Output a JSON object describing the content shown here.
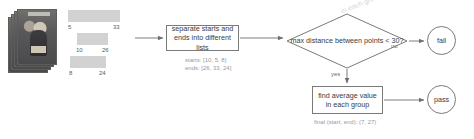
{
  "diagram": {
    "type": "flowchart",
    "source": {
      "name": "photo-stack",
      "count": 4
    },
    "intervals": [
      {
        "start": "5",
        "end": "33"
      },
      {
        "start": "10",
        "end": "26"
      },
      {
        "start": "8",
        "end": "24"
      }
    ],
    "nodes": {
      "separate": {
        "line1": "separate starts and",
        "line2": "ends into different lists"
      },
      "decision": {
        "line1": "max distance between",
        "line2": "points < 30?"
      },
      "average": {
        "line1": "find average value",
        "line2": "in each group"
      },
      "fail": {
        "label": "fail"
      },
      "pass": {
        "label": "pass"
      }
    },
    "edge_labels": {
      "no": "no",
      "yes": "yes"
    },
    "annotations": {
      "starts": "starts: [10, 5, 8]",
      "ends": "ends: [26, 33, 24]",
      "final": "final (start, end): (7, 27)",
      "ghost": "in each group"
    },
    "colors": {
      "bar": "#d2d2d2",
      "stroke": "#7a7a7a",
      "text": "#3b3b3b",
      "annotation": "#9a9a9a",
      "background": "#ffffff"
    }
  }
}
